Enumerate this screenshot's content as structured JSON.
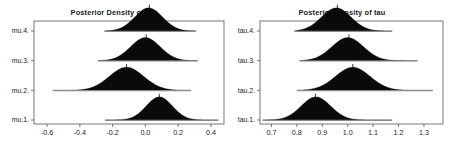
{
  "figure": {
    "background_color": "#ffffff",
    "frame_color": "#555555",
    "density_fill": "#0a0a0a",
    "baseline_color": "#8a8a8a"
  },
  "panels": [
    {
      "id": "mu",
      "title": "Posterior Density of mu",
      "row_labels": [
        "mu.4.",
        "mu.3.",
        "mu.2.",
        "mu.1."
      ],
      "x_tick_labels": [
        "-0.6",
        "-0.4",
        "-0.2",
        "0.0",
        "0.2",
        "0.4"
      ]
    },
    {
      "id": "tau",
      "title": "Posterior Density of tau",
      "row_labels": [
        "tau.4.",
        "tau.3.",
        "tau.2.",
        "tau.1."
      ],
      "x_tick_labels": [
        "0.7",
        "0.8",
        "0.9",
        "1.0",
        "1.1",
        "1.2",
        "1.3"
      ]
    }
  ],
  "chart_data": [
    {
      "type": "area",
      "id": "mu",
      "title": "Posterior Density of mu",
      "xlabel": "",
      "ylabel": "",
      "xlim": [
        -0.68,
        0.48
      ],
      "x_ticks": [
        -0.6,
        -0.4,
        -0.2,
        0.0,
        0.2,
        0.4
      ],
      "x_tick_labels": [
        "-0.6",
        "-0.4",
        "-0.2",
        "0.0",
        "0.2",
        "0.4"
      ],
      "grid": false,
      "legend": "none",
      "series": [
        {
          "name": "mu.4.",
          "row": 4,
          "mean": 0.02,
          "mode_marker": 0.025,
          "range": [
            -0.25,
            0.31
          ],
          "sd": 0.085
        },
        {
          "name": "mu.3.",
          "row": 3,
          "mean": 0.0,
          "mode_marker": 0.005,
          "range": [
            -0.29,
            0.32
          ],
          "sd": 0.09
        },
        {
          "name": "mu.2.",
          "row": 2,
          "mean": -0.115,
          "mode_marker": -0.115,
          "range": [
            -0.565,
            0.28
          ],
          "sd": 0.105
        },
        {
          "name": "mu.1.",
          "row": 1,
          "mean": 0.085,
          "mode_marker": 0.085,
          "range": [
            -0.245,
            0.445
          ],
          "sd": 0.08
        }
      ]
    },
    {
      "type": "area",
      "id": "tau",
      "title": "Posterior Density of tau",
      "xlabel": "",
      "ylabel": "",
      "xlim": [
        0.655,
        1.375
      ],
      "x_ticks": [
        0.7,
        0.8,
        0.9,
        1.0,
        1.1,
        1.2,
        1.3
      ],
      "x_tick_labels": [
        "0.7",
        "0.8",
        "0.9",
        "1.0",
        "1.1",
        "1.2",
        "1.3"
      ],
      "grid": false,
      "legend": "none",
      "series": [
        {
          "name": "tau.4.",
          "row": 4,
          "mean": 0.955,
          "mode_marker": 0.96,
          "range": [
            0.79,
            1.175
          ],
          "sd": 0.058
        },
        {
          "name": "tau.3.",
          "row": 3,
          "mean": 1.0,
          "mode_marker": 1.005,
          "range": [
            0.81,
            1.275
          ],
          "sd": 0.062
        },
        {
          "name": "tau.2.",
          "row": 2,
          "mean": 1.02,
          "mode_marker": 1.02,
          "range": [
            0.8,
            1.335
          ],
          "sd": 0.068
        },
        {
          "name": "tau.1.",
          "row": 1,
          "mean": 0.875,
          "mode_marker": 0.873,
          "range": [
            0.665,
            1.175
          ],
          "sd": 0.058
        }
      ]
    }
  ]
}
